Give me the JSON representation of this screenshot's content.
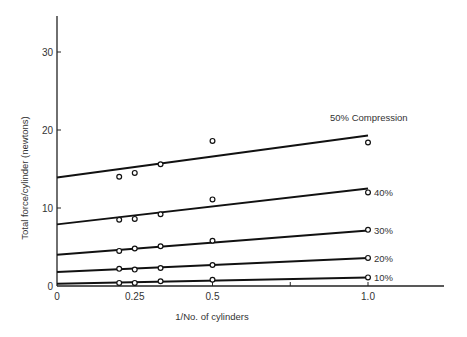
{
  "chart_data": {
    "type": "scatter",
    "title": "",
    "xlabel": "1/No. of cylinders",
    "ylabel": "Total force/cylinder (newtons)",
    "xlim": [
      0,
      1.2
    ],
    "ylim": [
      0,
      34
    ],
    "x_ticks": [
      {
        "value": 0,
        "label": "0"
      },
      {
        "value": 0.25,
        "label": "0.25"
      },
      {
        "value": 0.5,
        "label": "0.5"
      },
      {
        "value": 0.75,
        "label": ""
      },
      {
        "value": 1.0,
        "label": "1.0"
      }
    ],
    "y_ticks": [
      {
        "value": 0,
        "label": "0"
      },
      {
        "value": 10,
        "label": "10"
      },
      {
        "value": 20,
        "label": "20"
      },
      {
        "value": 30,
        "label": "30"
      }
    ],
    "grid": false,
    "legend": "inline labels at right end of fit lines",
    "x_points": [
      0.2,
      0.25,
      0.333,
      0.5,
      1.0
    ],
    "series": [
      {
        "name": "50% Compression",
        "fit": {
          "intercept": 13.9,
          "slope": 5.4
        },
        "points": [
          [
            0.2,
            14.0
          ],
          [
            0.25,
            14.5
          ],
          [
            0.333,
            15.6
          ],
          [
            0.5,
            18.6
          ],
          [
            1.0,
            18.4
          ]
        ]
      },
      {
        "name": "40%",
        "fit": {
          "intercept": 7.9,
          "slope": 4.6
        },
        "points": [
          [
            0.2,
            8.5
          ],
          [
            0.25,
            8.6
          ],
          [
            0.333,
            9.2
          ],
          [
            0.5,
            11.1
          ],
          [
            1.0,
            12.0
          ]
        ]
      },
      {
        "name": "30%",
        "fit": {
          "intercept": 4.0,
          "slope": 3.1
        },
        "points": [
          [
            0.2,
            4.5
          ],
          [
            0.25,
            4.8
          ],
          [
            0.333,
            5.1
          ],
          [
            0.5,
            5.8
          ],
          [
            1.0,
            7.2
          ]
        ]
      },
      {
        "name": "20%",
        "fit": {
          "intercept": 1.8,
          "slope": 1.8
        },
        "points": [
          [
            0.2,
            2.2
          ],
          [
            0.25,
            2.1
          ],
          [
            0.333,
            2.3
          ],
          [
            0.5,
            2.7
          ],
          [
            1.0,
            3.6
          ]
        ]
      },
      {
        "name": "10%",
        "fit": {
          "intercept": 0.3,
          "slope": 0.8
        },
        "points": [
          [
            0.2,
            0.4
          ],
          [
            0.25,
            0.4
          ],
          [
            0.333,
            0.6
          ],
          [
            0.5,
            0.8
          ],
          [
            1.0,
            1.1
          ]
        ]
      }
    ]
  }
}
